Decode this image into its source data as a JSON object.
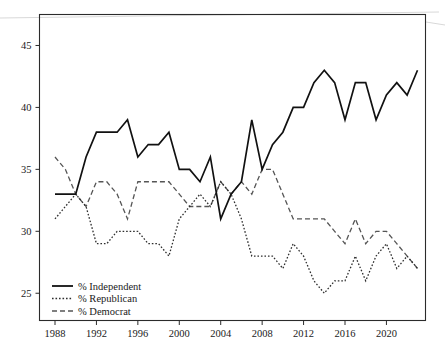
{
  "chart_data": {
    "type": "line",
    "title": "",
    "subtitle": "",
    "xlabel": "",
    "ylabel": "",
    "xlim": [
      1988,
      2023
    ],
    "ylim": [
      22.8,
      47.5
    ],
    "grid": false,
    "legend_position": "bottom-left",
    "x_ticks": [
      1988,
      1992,
      1996,
      2000,
      2004,
      2008,
      2012,
      2016,
      2020
    ],
    "y_ticks": [
      25,
      30,
      35,
      40,
      45
    ],
    "x": [
      1988,
      1989,
      1990,
      1991,
      1992,
      1993,
      1994,
      1995,
      1996,
      1997,
      1998,
      1999,
      2000,
      2001,
      2002,
      2003,
      2004,
      2005,
      2006,
      2007,
      2008,
      2009,
      2010,
      2011,
      2012,
      2013,
      2014,
      2015,
      2016,
      2017,
      2018,
      2019,
      2020,
      2021,
      2022,
      2023
    ],
    "series": [
      {
        "name": "% Independent",
        "style": "solid",
        "color": "#111111",
        "values": [
          33,
          33,
          33,
          36,
          38,
          38,
          38,
          39,
          36,
          37,
          37,
          38,
          35,
          35,
          34,
          36,
          31,
          33,
          34,
          39,
          35,
          37,
          38,
          40,
          40,
          42,
          43,
          42,
          39,
          42,
          42,
          39,
          41,
          42,
          41,
          43
        ]
      },
      {
        "name": "% Republican",
        "style": "dotted",
        "color": "#2e2e2e",
        "values": [
          31,
          32,
          33,
          32,
          29,
          29,
          30,
          30,
          30,
          29,
          29,
          28,
          31,
          32,
          33,
          32,
          34,
          33,
          31,
          28,
          28,
          28,
          27,
          29,
          28,
          26,
          25,
          26,
          26,
          28,
          26,
          28,
          29,
          27,
          28,
          27
        ]
      },
      {
        "name": "% Democrat",
        "style": "dashed",
        "color": "#555555",
        "values": [
          36,
          35,
          33,
          32,
          34,
          34,
          33,
          31,
          34,
          34,
          34,
          34,
          33,
          32,
          32,
          32,
          34,
          33,
          34,
          33,
          35,
          35,
          33,
          31,
          31,
          31,
          31,
          30,
          29,
          31,
          29,
          30,
          30,
          29,
          28,
          27
        ]
      }
    ]
  },
  "legend": {
    "items": [
      {
        "label": "% Independent",
        "style": "solid"
      },
      {
        "label": "% Republican",
        "style": "dotted"
      },
      {
        "label": "% Democrat",
        "style": "dashed"
      }
    ]
  },
  "axes": {
    "y_tick_labels": [
      "45",
      "40",
      "35",
      "30",
      "25"
    ],
    "x_tick_labels": [
      "1988",
      "1992",
      "1996",
      "2000",
      "2004",
      "2008",
      "2012",
      "2016",
      "2020"
    ]
  }
}
